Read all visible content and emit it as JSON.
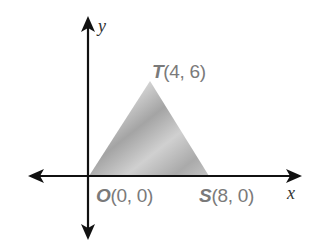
{
  "diagram": {
    "type": "coordinate-plane-triangle",
    "axes": {
      "x_label": "x",
      "y_label": "y"
    },
    "colors": {
      "axis": "#111111",
      "label_text": "#7a7a7a",
      "fill_light": "#d8d8d8",
      "fill_dark": "#9a9a9a"
    },
    "points": [
      {
        "name": "O",
        "coords": "(0, 0)",
        "x": 0,
        "y": 0
      },
      {
        "name": "T",
        "coords": "(4, 6)",
        "x": 4,
        "y": 6
      },
      {
        "name": "S",
        "coords": "(8, 0)",
        "x": 8,
        "y": 0
      }
    ],
    "shape": {
      "type": "triangle",
      "vertices": [
        "O",
        "T",
        "S"
      ],
      "fill": "shaded gray"
    }
  }
}
